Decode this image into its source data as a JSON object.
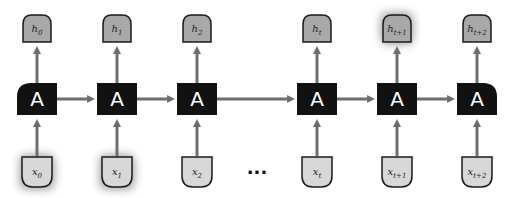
{
  "diagram": {
    "cell_label": "A",
    "ellipsis": "...",
    "colors": {
      "cell": "#111111",
      "cell_text": "#ffffff",
      "output_fill": "#a9a9a9",
      "input_fill": "#d8d8d8",
      "arrow": "#6e6e6e",
      "highlight_glow": "#9a9a9a"
    },
    "steps": [
      {
        "input": {
          "base": "x",
          "sub": "0"
        },
        "output": {
          "base": "h",
          "sub": "0"
        },
        "cell_shape": "rounded-left",
        "highlight_input": true,
        "highlight_output": false
      },
      {
        "input": {
          "base": "x",
          "sub": "1"
        },
        "output": {
          "base": "h",
          "sub": "1"
        },
        "cell_shape": "square",
        "highlight_input": true,
        "highlight_output": false
      },
      {
        "input": {
          "base": "x",
          "sub": "2"
        },
        "output": {
          "base": "h",
          "sub": "2"
        },
        "cell_shape": "square",
        "highlight_input": false,
        "highlight_output": false
      },
      {
        "input": {
          "base": "x",
          "sub": "t"
        },
        "output": {
          "base": "h",
          "sub": "t"
        },
        "cell_shape": "square",
        "highlight_input": false,
        "highlight_output": false
      },
      {
        "input": {
          "base": "x",
          "sub": "t+1"
        },
        "output": {
          "base": "h",
          "sub": "t+1"
        },
        "cell_shape": "square",
        "highlight_input": false,
        "highlight_output": true
      },
      {
        "input": {
          "base": "x",
          "sub": "t+2"
        },
        "output": {
          "base": "h",
          "sub": "t+2"
        },
        "cell_shape": "rounded-right",
        "highlight_input": false,
        "highlight_output": false
      }
    ]
  }
}
